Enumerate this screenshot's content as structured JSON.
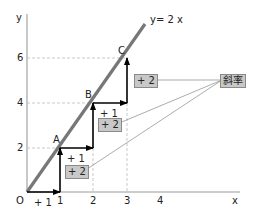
{
  "diagram": {
    "axes": {
      "x_label": "x",
      "y_label": "y",
      "origin_label": "O",
      "x_ticks": [
        "1",
        "2",
        "3",
        "4"
      ],
      "y_ticks": [
        "2",
        "4",
        "6"
      ]
    },
    "line": {
      "label": "y= 2 x",
      "equation": "y=2x",
      "color": "#777777"
    },
    "points": [
      {
        "name": "A",
        "x": 1,
        "y": 2
      },
      {
        "name": "B",
        "x": 2,
        "y": 4
      },
      {
        "name": "C",
        "x": 3,
        "y": 6
      }
    ],
    "steps": {
      "run_labels": [
        "+ 1",
        "+ 1",
        "+ 1"
      ],
      "rise_labels": [
        "+ 2",
        "+ 2",
        "+ 2"
      ]
    },
    "callout": {
      "label": "斜率"
    },
    "colors": {
      "axis": "#bbbbbb",
      "grid_dash": "#bbbbbb",
      "arrow": "#000000",
      "box_fill": "#c8c8c8",
      "box_border": "#8a8a8a",
      "connector": "#888888"
    }
  }
}
